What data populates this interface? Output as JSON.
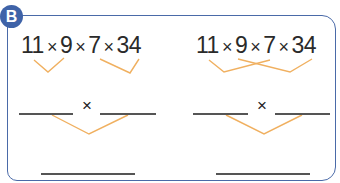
{
  "badge": {
    "label": "B",
    "color": "#3f63a8"
  },
  "left_problem": {
    "factors": [
      "11",
      "9",
      "7",
      "34"
    ],
    "operator": "×",
    "grouping": "adjacent pairs (11×9) and (7×34)",
    "blank_operator": "×"
  },
  "right_problem": {
    "factors": [
      "11",
      "9",
      "7",
      "34"
    ],
    "operator": "×",
    "grouping": "crossed pairs (11×7) and (9×34)",
    "blank_operator": "×"
  },
  "colors": {
    "bracket": "#f0b060",
    "border": "#4a6aa8",
    "blank_line": "#555555"
  }
}
